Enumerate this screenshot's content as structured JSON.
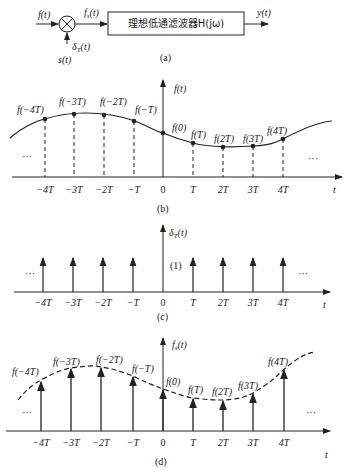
{
  "block": {
    "input": "f(t)",
    "sampler_out": "fs(t)",
    "filter": "理想低通滤波器H(jω)",
    "output": "y(t)",
    "impulse_label": "δT(t)",
    "s_label": "s(t)",
    "caption": "(a)"
  },
  "panel_b": {
    "ylabel": "f(t)",
    "caption": "(b)",
    "samples": [
      "f(−4T)",
      "f(−3T)",
      "f(−2T)",
      "f(−T)",
      "f(0)",
      "f(T)",
      "f(2T)",
      "f(3T)",
      "f(4T)"
    ]
  },
  "panel_c": {
    "ylabel": "δT(t)",
    "weight": "(1)",
    "caption": "(c)"
  },
  "panel_d": {
    "ylabel": "fs(t)",
    "caption": "(d)",
    "samples": [
      "f(−4T)",
      "f(−3T)",
      "f(−2T)",
      "f(−T)",
      "f(0)",
      "f(T)",
      "f(2T)",
      "f(3T)",
      "f(4T)"
    ]
  },
  "axis": {
    "ticks": [
      "−4T",
      "−3T",
      "−2T",
      "−T",
      "0",
      "T",
      "2T",
      "3T",
      "4T"
    ],
    "xlabel": "t",
    "ellipsis": "···"
  }
}
